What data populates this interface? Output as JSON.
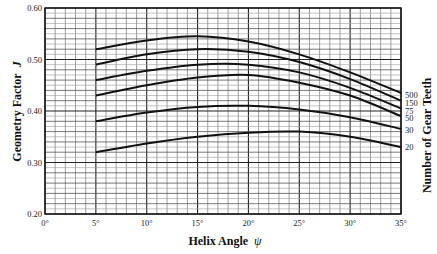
{
  "chart_data": {
    "type": "line",
    "title": "",
    "xlabel": "Helix Angle",
    "xlabel_symbol": "ψ",
    "ylabel": "Geometry Factor",
    "ylabel_symbol": "J",
    "legend_title": "Number of Gear Teeth",
    "legend_position": "right",
    "grid": true,
    "xlim": [
      0,
      35
    ],
    "ylim": [
      0.2,
      0.6
    ],
    "x_ticks": [
      "0°",
      "5°",
      "10°",
      "15°",
      "20°",
      "25°",
      "30°",
      "35°"
    ],
    "y_ticks": [
      "0.20",
      "0.30",
      "0.40",
      "0.50",
      "0.60"
    ],
    "x": [
      5,
      10,
      15,
      20,
      25,
      30,
      35
    ],
    "series": [
      {
        "name": "500",
        "values": [
          0.52,
          0.537,
          0.545,
          0.535,
          0.51,
          0.475,
          0.435
        ]
      },
      {
        "name": "150",
        "values": [
          0.49,
          0.51,
          0.52,
          0.515,
          0.495,
          0.462,
          0.42
        ]
      },
      {
        "name": "75",
        "values": [
          0.46,
          0.478,
          0.49,
          0.49,
          0.475,
          0.445,
          0.405
        ]
      },
      {
        "name": "50",
        "values": [
          0.43,
          0.45,
          0.465,
          0.47,
          0.455,
          0.43,
          0.39
        ]
      },
      {
        "name": "30",
        "values": [
          0.38,
          0.397,
          0.408,
          0.41,
          0.403,
          0.388,
          0.365
        ]
      },
      {
        "name": "20",
        "values": [
          0.32,
          0.337,
          0.35,
          0.358,
          0.36,
          0.35,
          0.33
        ]
      }
    ]
  },
  "labels": {
    "ylabel": "Geometry Factor",
    "ylabel_symbol": "J",
    "xlabel": "Helix Angle",
    "xlabel_symbol": "ψ",
    "legend_title": "Number of Gear Teeth"
  }
}
